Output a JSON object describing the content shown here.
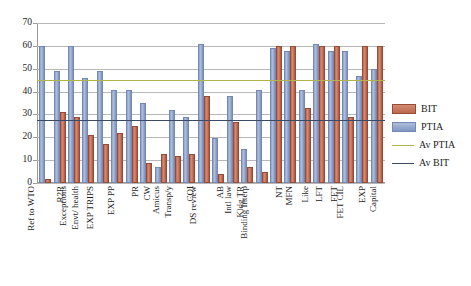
{
  "chart_data": {
    "type": "bar",
    "title": "",
    "xlabel": "",
    "ylabel": "",
    "ylim": [
      0,
      70
    ],
    "ytick_step": 10,
    "yticks": [
      "0",
      "10",
      "20",
      "30",
      "40",
      "50",
      "60",
      "70"
    ],
    "grid": true,
    "legend_position": "right",
    "categories": [
      "Ref to WTO",
      "R2R",
      "Exceptions",
      "Envt/ health",
      "EXP TRIPS",
      "EXP PP",
      "PR",
      "CW",
      "Amicus",
      "Transp/y",
      "COI",
      "DS review",
      "AB",
      "Intl law",
      "Kldg TR",
      "Binding Interp",
      "NT",
      "MFN",
      "Like",
      "LFT",
      "FET",
      "FET CIL",
      "EXP",
      "Capital"
    ],
    "series": [
      {
        "name": "BIT",
        "color": "#c4705a",
        "values": [
          1,
          30,
          28,
          20,
          16,
          21,
          24,
          8,
          12,
          11,
          12,
          37,
          3,
          26,
          6,
          4,
          59,
          59,
          32,
          59,
          59,
          28,
          59,
          59
        ]
      },
      {
        "name": "PTIA",
        "color": "#8fa3c8",
        "values": [
          59,
          48,
          59,
          45,
          48,
          40,
          40,
          34,
          6,
          31,
          28,
          60,
          19,
          37,
          14,
          40,
          58,
          57,
          40,
          60,
          57,
          57,
          46,
          49
        ]
      }
    ],
    "reference_lines": [
      {
        "name": "Av PTIA",
        "value": 45,
        "color": "#b0b44a"
      },
      {
        "name": "Av BIT",
        "value": 27.5,
        "color": "#3b4a66"
      }
    ],
    "legend": [
      {
        "label": "BIT",
        "swatch": "bar-red"
      },
      {
        "label": "PTIA",
        "swatch": "bar-blue"
      },
      {
        "label": "Av PTIA",
        "swatch": "line-olive"
      },
      {
        "label": "Av BIT",
        "swatch": "line-navy"
      }
    ]
  }
}
